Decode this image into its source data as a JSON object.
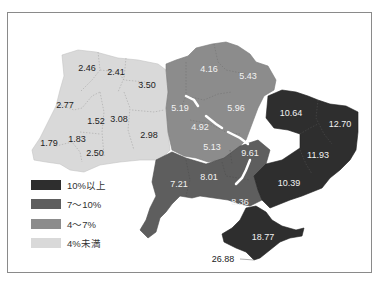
{
  "map": {
    "subject": "Ukraine regional percentages",
    "colors": {
      "over10": "#2e2e2e",
      "7to10": "#5e5e5e",
      "4to7": "#8c8c8c",
      "under4": "#d9d9d9",
      "frame": "#8a8a8a",
      "water": "#ffffff"
    },
    "legend": [
      {
        "label": "10%以上",
        "class": "over10"
      },
      {
        "label": "7～10%",
        "class": "7to10"
      },
      {
        "label": "4～7%",
        "class": "4to7"
      },
      {
        "label": "4%未満",
        "class": "under4"
      }
    ],
    "regions": [
      {
        "value": "2.46",
        "class": "under4"
      },
      {
        "value": "2.41",
        "class": "under4"
      },
      {
        "value": "3.50",
        "class": "under4"
      },
      {
        "value": "2.77",
        "class": "under4"
      },
      {
        "value": "1.52",
        "class": "under4"
      },
      {
        "value": "3.08",
        "class": "under4"
      },
      {
        "value": "1.79",
        "class": "under4"
      },
      {
        "value": "1.83",
        "class": "under4"
      },
      {
        "value": "2.50",
        "class": "under4"
      },
      {
        "value": "2.98",
        "class": "under4"
      },
      {
        "value": "4.16",
        "class": "4to7"
      },
      {
        "value": "5.43",
        "class": "4to7"
      },
      {
        "value": "5.19",
        "class": "4to7"
      },
      {
        "value": "5.96",
        "class": "4to7"
      },
      {
        "value": "4.92",
        "class": "4to7"
      },
      {
        "value": "5.13",
        "class": "4to7"
      },
      {
        "value": "9.61",
        "class": "7to10"
      },
      {
        "value": "7.21",
        "class": "7to10"
      },
      {
        "value": "8.01",
        "class": "7to10"
      },
      {
        "value": "8.36",
        "class": "7to10"
      },
      {
        "value": "10.64",
        "class": "over10"
      },
      {
        "value": "12.70",
        "class": "over10"
      },
      {
        "value": "11.93",
        "class": "over10"
      },
      {
        "value": "10.39",
        "class": "over10"
      },
      {
        "value": "18.77",
        "class": "over10"
      }
    ],
    "callout": {
      "value": "26.88"
    }
  }
}
